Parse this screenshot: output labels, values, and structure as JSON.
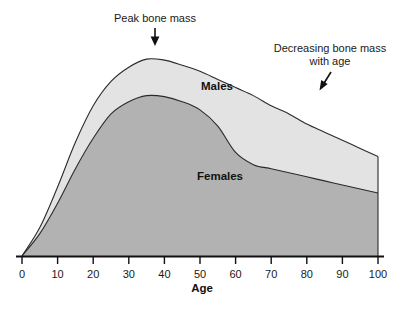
{
  "chart_data": {
    "type": "area",
    "title": "",
    "subtitle": "",
    "xlabel": "Age",
    "ylabel": "",
    "xlim": [
      0,
      100
    ],
    "ylim": [
      0,
      100
    ],
    "grid": false,
    "legend_position": "inline-labels",
    "xticks": [
      "0",
      "10",
      "20",
      "30",
      "40",
      "50",
      "60",
      "70",
      "80",
      "90",
      "100"
    ],
    "xtick_values": [
      0,
      10,
      20,
      30,
      40,
      50,
      60,
      70,
      80,
      90,
      100
    ],
    "yticks": [],
    "x": [
      0,
      5,
      10,
      15,
      20,
      25,
      30,
      35,
      40,
      45,
      50,
      55,
      60,
      65,
      70,
      75,
      80,
      85,
      90,
      95,
      100
    ],
    "series": [
      {
        "name": "Males",
        "label": "Males",
        "fill_color": "#e3e3e3",
        "line_color": "#2b2b2b",
        "values": [
          0,
          14,
          34,
          56,
          74,
          86,
          93,
          97,
          96.5,
          94,
          91,
          87,
          83,
          79,
          74,
          70,
          65,
          61,
          57,
          53,
          49
        ]
      },
      {
        "name": "Females",
        "label": "Females",
        "fill_color": "#b2b2b2",
        "line_color": "#2b2b2b",
        "values": [
          0,
          11,
          26,
          43,
          58,
          70,
          76,
          79,
          78.5,
          76,
          72,
          64,
          51,
          45,
          43,
          41,
          39,
          37,
          35,
          33,
          31
        ]
      }
    ],
    "annotations": [
      {
        "id": "peak-bone-mass",
        "text": "Peak bone mass",
        "arrow": "down",
        "points_at_age": 35
      },
      {
        "id": "decreasing-bone-mass",
        "text_line1": "Decreasing bone mass",
        "text_line2": "with age",
        "arrow": "down-left",
        "points_at_age": 85
      }
    ],
    "colors": {
      "males_fill": "#e3e3e3",
      "females_fill": "#b2b2b2",
      "curve_stroke": "#2b2b2b",
      "axis": "#111111",
      "background": "#ffffff"
    }
  }
}
